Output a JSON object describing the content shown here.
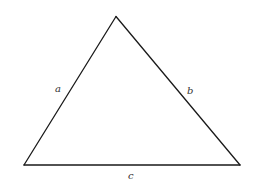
{
  "diagram": {
    "type": "triangle",
    "stroke_color": "#1a1a1a",
    "background": "#ffffff",
    "vertices": {
      "apex": [
        116,
        16.5
      ],
      "bottom_left": [
        24,
        165
      ],
      "bottom_right": [
        240,
        165
      ]
    },
    "sides": [
      {
        "id": "a",
        "label": "a",
        "between": [
          "bottom_left",
          "apex"
        ]
      },
      {
        "id": "b",
        "label": "b",
        "between": [
          "apex",
          "bottom_right"
        ]
      },
      {
        "id": "c",
        "label": "c",
        "between": [
          "bottom_left",
          "bottom_right"
        ]
      }
    ],
    "labels": {
      "a": "a",
      "b": "b",
      "c": "c"
    }
  }
}
